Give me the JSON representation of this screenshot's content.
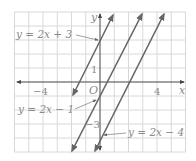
{
  "figure": {
    "type": "coordinate-graph",
    "grid": {
      "x_min": -6,
      "x_max": 6,
      "y_min": -5,
      "y_max": 5,
      "step": 1
    },
    "axes": {
      "x_label": "x",
      "y_label": "y",
      "origin_label": "O"
    },
    "ticks": {
      "x_neg": "−4",
      "x_pos": "4",
      "y_pos": "1",
      "y_neg": "−3"
    },
    "lines": [
      {
        "equation": "y = 2x + 3",
        "slope": 2,
        "intercept": 3
      },
      {
        "equation": "y = 2x − 1",
        "slope": 2,
        "intercept": -1
      },
      {
        "equation": "y = 2x − 4",
        "slope": 2,
        "intercept": -4
      }
    ],
    "colors": {
      "grid": "#d8d8d8",
      "axis": "#555555",
      "line": "#666666",
      "text": "#8a8a8a"
    }
  }
}
